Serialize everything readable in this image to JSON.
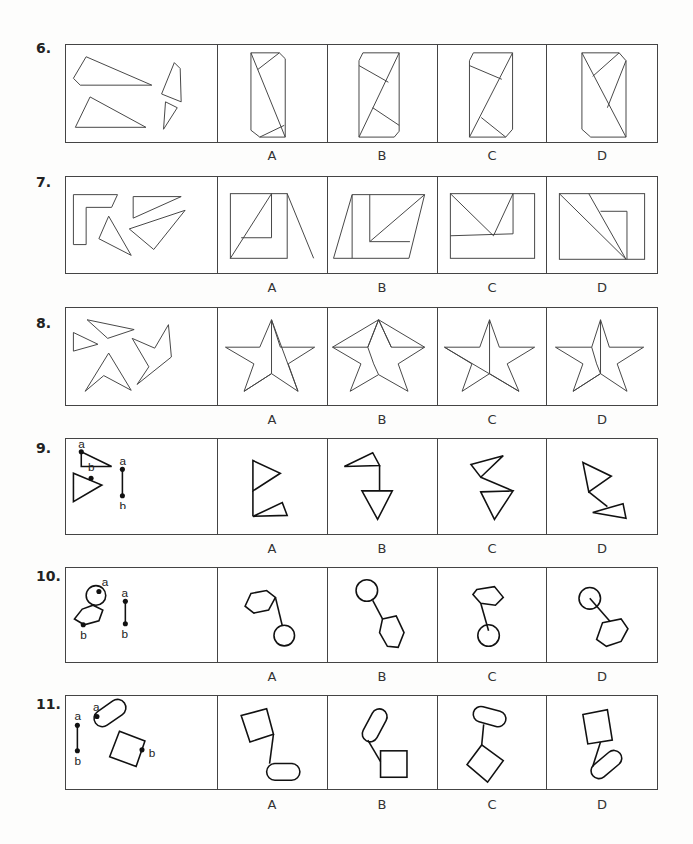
{
  "questions": [
    {
      "number": "6.",
      "options": [
        "A",
        "B",
        "C",
        "D"
      ],
      "prompt_type": "assemble-pieces",
      "pieces": "four polygons (two trapezoidal pieces, two small quadrilaterals)"
    },
    {
      "number": "7.",
      "options": [
        "A",
        "B",
        "C",
        "D"
      ],
      "prompt_type": "assemble-pieces",
      "pieces": "L-shape, triangle, two triangles"
    },
    {
      "number": "8.",
      "options": [
        "A",
        "B",
        "C",
        "D"
      ],
      "prompt_type": "assemble-pieces",
      "pieces": "star fragments"
    },
    {
      "number": "9.",
      "options": [
        "A",
        "B",
        "C",
        "D"
      ],
      "prompt_type": "connect-points",
      "point_labels": [
        "a",
        "b"
      ]
    },
    {
      "number": "10.",
      "options": [
        "A",
        "B",
        "C",
        "D"
      ],
      "prompt_type": "connect-points",
      "point_labels": [
        "a",
        "b"
      ]
    },
    {
      "number": "11.",
      "options": [
        "A",
        "B",
        "C",
        "D"
      ],
      "prompt_type": "connect-points",
      "point_labels": [
        "a",
        "b"
      ]
    }
  ],
  "labels": {
    "a": "a",
    "b": "b"
  }
}
